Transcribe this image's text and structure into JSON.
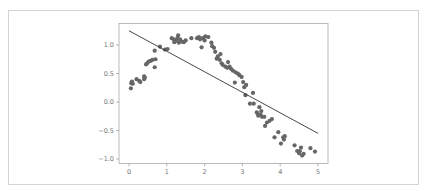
{
  "chart_data": {
    "type": "scatter",
    "title": "",
    "xlabel": "",
    "ylabel": "",
    "xlim": [
      -0.25,
      5.25
    ],
    "ylim": [
      -1.08,
      1.35
    ],
    "grid": false,
    "legend": null,
    "x_ticks": [
      "0",
      "1",
      "2",
      "3",
      "4",
      "5"
    ],
    "y_ticks": [
      "1.0",
      "0.5",
      "0.0",
      "−0.5",
      "−1.0"
    ],
    "point_color": "#666666",
    "line_color": "#333333",
    "series": [
      {
        "name": "data",
        "type": "scatter",
        "points": [
          [
            0.05,
            0.24
          ],
          [
            0.06,
            0.33
          ],
          [
            0.08,
            0.36
          ],
          [
            0.1,
            0.32
          ],
          [
            0.2,
            0.4
          ],
          [
            0.27,
            0.37
          ],
          [
            0.3,
            0.35
          ],
          [
            0.4,
            0.45
          ],
          [
            0.4,
            0.4
          ],
          [
            0.42,
            0.43
          ],
          [
            0.45,
            0.66
          ],
          [
            0.48,
            0.68
          ],
          [
            0.52,
            0.71
          ],
          [
            0.57,
            0.72
          ],
          [
            0.62,
            0.74
          ],
          [
            0.68,
            0.61
          ],
          [
            0.7,
            0.75
          ],
          [
            0.68,
            0.9
          ],
          [
            0.82,
            0.97
          ],
          [
            0.95,
            0.92
          ],
          [
            1.02,
            0.93
          ],
          [
            1.13,
            1.12
          ],
          [
            1.18,
            1.1
          ],
          [
            1.2,
            1.05
          ],
          [
            1.25,
            1.08
          ],
          [
            1.28,
            1.12
          ],
          [
            1.3,
            1.17
          ],
          [
            1.32,
            1.04
          ],
          [
            1.35,
            1.1
          ],
          [
            1.4,
            1.06
          ],
          [
            1.45,
            1.05
          ],
          [
            1.5,
            1.08
          ],
          [
            1.65,
            1.12
          ],
          [
            1.8,
            1.12
          ],
          [
            1.85,
            1.14
          ],
          [
            1.88,
            1.1
          ],
          [
            1.92,
            0.96
          ],
          [
            1.95,
            1.12
          ],
          [
            2.0,
            1.08
          ],
          [
            2.02,
            1.15
          ],
          [
            2.1,
            1.14
          ],
          [
            2.18,
            1.04
          ],
          [
            2.2,
            0.98
          ],
          [
            2.25,
            0.95
          ],
          [
            2.28,
            0.88
          ],
          [
            2.32,
            0.76
          ],
          [
            2.35,
            0.8
          ],
          [
            2.4,
            0.74
          ],
          [
            2.42,
            0.84
          ],
          [
            2.45,
            0.68
          ],
          [
            2.48,
            0.65
          ],
          [
            2.55,
            0.62
          ],
          [
            2.6,
            0.6
          ],
          [
            2.62,
            0.7
          ],
          [
            2.66,
            0.62
          ],
          [
            2.7,
            0.58
          ],
          [
            2.75,
            0.55
          ],
          [
            2.8,
            0.34
          ],
          [
            2.82,
            0.52
          ],
          [
            2.88,
            0.5
          ],
          [
            2.92,
            0.47
          ],
          [
            2.98,
            0.44
          ],
          [
            3.02,
            0.35
          ],
          [
            3.05,
            0.26
          ],
          [
            3.08,
            0.12
          ],
          [
            3.1,
            0.3
          ],
          [
            3.2,
            -0.03
          ],
          [
            3.28,
            0.16
          ],
          [
            3.3,
            -0.03
          ],
          [
            3.38,
            -0.18
          ],
          [
            3.4,
            -0.2
          ],
          [
            3.42,
            -0.24
          ],
          [
            3.45,
            -0.09
          ],
          [
            3.48,
            -0.22
          ],
          [
            3.5,
            -0.16
          ],
          [
            3.52,
            -0.26
          ],
          [
            3.58,
            -0.26
          ],
          [
            3.6,
            -0.42
          ],
          [
            3.65,
            -0.36
          ],
          [
            3.72,
            -0.33
          ],
          [
            3.78,
            -0.3
          ],
          [
            3.85,
            -0.62
          ],
          [
            3.95,
            -0.53
          ],
          [
            4.02,
            -0.73
          ],
          [
            4.08,
            -0.62
          ],
          [
            4.1,
            -0.66
          ],
          [
            4.12,
            -0.6
          ],
          [
            4.38,
            -0.76
          ],
          [
            4.45,
            -0.86
          ],
          [
            4.5,
            -0.9
          ],
          [
            4.52,
            -0.86
          ],
          [
            4.55,
            -0.8
          ],
          [
            4.58,
            -0.94
          ],
          [
            4.62,
            -0.91
          ],
          [
            4.8,
            -0.81
          ],
          [
            4.92,
            -0.87
          ]
        ]
      },
      {
        "name": "linear fit",
        "type": "line",
        "points": [
          [
            0.0,
            1.25
          ],
          [
            5.0,
            -0.55
          ]
        ]
      }
    ]
  }
}
